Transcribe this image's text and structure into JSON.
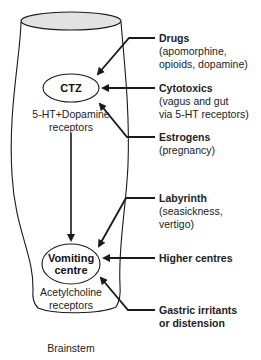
{
  "diagram": {
    "nodes": {
      "ctz": {
        "label": "CTZ",
        "receptors_line1": "5-HT+Dopamine",
        "receptors_line2": "receptors"
      },
      "vomiting_centre": {
        "label_line1": "Vomiting",
        "label_line2": "centre",
        "receptors_line1": "Acetylcholine",
        "receptors_line2": "receptors"
      },
      "brainstem": {
        "label": "Brainstem"
      }
    },
    "inputs": [
      {
        "title": "Drugs",
        "detail_line1": "(apomorphine,",
        "detail_line2": "opioids, dopamine)",
        "target": "CTZ"
      },
      {
        "title": "Cytotoxics",
        "detail_line1": "(vagus and gut",
        "detail_line2": "via 5-HT receptors)",
        "target": "CTZ"
      },
      {
        "title": "Estrogens",
        "detail_line1": "(pregnancy)",
        "target": "CTZ"
      },
      {
        "title": "Labyrinth",
        "detail_line1": "(seasickness,",
        "detail_line2": "vertigo)",
        "target": "Vomiting centre"
      },
      {
        "title": "Higher centres",
        "target": "Vomiting centre"
      },
      {
        "title_line1": "Gastric irritants",
        "title_line2": "or distension",
        "target": "Vomiting centre"
      }
    ],
    "edges": [
      {
        "from": "CTZ",
        "to": "Vomiting centre"
      }
    ],
    "colors": {
      "line": "#1a1a1a",
      "cap_fill": "#e2e2e2",
      "text": "#222222"
    }
  }
}
